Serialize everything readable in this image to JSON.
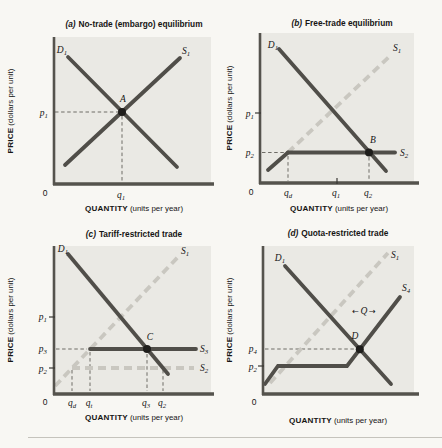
{
  "figure": {
    "description_title_row": [
      "No-trade (embargo) equilibrium",
      "Free-trade equilibrium",
      "Tariff-restricted trade",
      "Quota-restricted trade"
    ],
    "colors": {
      "page_bg": "#f8f7f3",
      "plot_bg": "#eae9e4",
      "axis": "#55534d",
      "solid_curve": "#504e49",
      "dashed_curve": "#c9c7c0",
      "guide": "#6e6c66",
      "text": "#161514"
    }
  },
  "axis_labels": {
    "price_strong": "PRICE",
    "price_rest": "(dollars per unit)",
    "quantity_strong": "QUANTITY",
    "quantity_rest": "(units per year)"
  },
  "panels": [
    {
      "key": "a",
      "title_tag": "(a)",
      "title_text": "No-trade (embargo) equilibrium",
      "labels": {
        "demand": {
          "m": "D",
          "s": "1"
        },
        "supply1": {
          "m": "S",
          "s": "1"
        },
        "point": {
          "m": "A",
          "s": ""
        },
        "price1": {
          "m": "p",
          "s": "1"
        },
        "qty1": {
          "m": "q",
          "s": "1"
        },
        "zero": "0"
      }
    },
    {
      "key": "b",
      "title_tag": "(b)",
      "title_text": "Free-trade equilibrium",
      "labels": {
        "demand": {
          "m": "D",
          "s": "1"
        },
        "supply1": {
          "m": "S",
          "s": "1"
        },
        "supply2": {
          "m": "S",
          "s": "2"
        },
        "point": {
          "m": "B",
          "s": ""
        },
        "price1": {
          "m": "p",
          "s": "1"
        },
        "price2": {
          "m": "p",
          "s": "2"
        },
        "qty_d": {
          "m": "q",
          "s": "d"
        },
        "qty1": {
          "m": "q",
          "s": "1"
        },
        "qty2": {
          "m": "q",
          "s": "2"
        },
        "zero": "0"
      }
    },
    {
      "key": "c",
      "title_tag": "(c)",
      "title_text": "Tariff-restricted trade",
      "labels": {
        "demand": {
          "m": "D",
          "s": "1"
        },
        "supply1": {
          "m": "S",
          "s": "1"
        },
        "supply3": {
          "m": "S",
          "s": "3"
        },
        "supply2": {
          "m": "S",
          "s": "2"
        },
        "point": {
          "m": "C",
          "s": ""
        },
        "price1": {
          "m": "p",
          "s": "1"
        },
        "price3": {
          "m": "p",
          "s": "3"
        },
        "price2": {
          "m": "p",
          "s": "2"
        },
        "qty_d": {
          "m": "q",
          "s": "d"
        },
        "qty_t": {
          "m": "q",
          "s": "t"
        },
        "qty3": {
          "m": "q",
          "s": "3"
        },
        "qty2": {
          "m": "q",
          "s": "2"
        },
        "zero": "0"
      }
    },
    {
      "key": "d",
      "title_tag": "(d)",
      "title_text": "Quota-restricted trade",
      "labels": {
        "demand": {
          "m": "D",
          "s": "1"
        },
        "supply1": {
          "m": "S",
          "s": "1"
        },
        "supply4": {
          "m": "S",
          "s": "4"
        },
        "point": {
          "m": "D",
          "s": ""
        },
        "price4": {
          "m": "p",
          "s": "4"
        },
        "price2": {
          "m": "p",
          "s": "2"
        },
        "quota": {
          "left": "←",
          "m": "Q",
          "right": "→"
        },
        "zero": "0"
      }
    }
  ]
}
